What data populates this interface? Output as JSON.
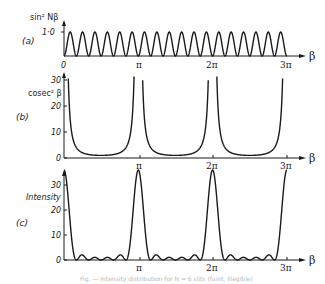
{
  "figure": {
    "caption": "Fig. — Intensity distribution for N = 6 slits (faint, illegible)",
    "x_axis_symbol": "β",
    "x_tick_labels": [
      "0",
      "π",
      "2π",
      "3π"
    ]
  },
  "chart_data": [
    {
      "panel": "(a)",
      "type": "line",
      "ylabel": "sin² Nβ",
      "xlabel": "β",
      "function": "sin^2(6β)",
      "x_range": [
        0,
        9.42
      ],
      "x_ticks": [
        "0",
        "π",
        "2π",
        "3π"
      ],
      "y_ticks": [
        "1·0"
      ],
      "ylim": [
        0,
        1.0
      ],
      "periods_per_pi": 6,
      "grid": false
    },
    {
      "panel": "(b)",
      "type": "line",
      "ylabel": "cosec² β",
      "xlabel": "β",
      "function": "1/sin^2(β)",
      "x_range": [
        0,
        9.42
      ],
      "x_ticks": [
        "π",
        "2π",
        "3π"
      ],
      "y_ticks": [
        "0",
        "10",
        "20",
        "30"
      ],
      "ylim": [
        0,
        35
      ],
      "asymptotes_at": [
        "0",
        "π",
        "2π",
        "3π"
      ],
      "minimum_value": 1,
      "grid": false
    },
    {
      "panel": "(c)",
      "type": "line",
      "ylabel": "Intensity",
      "xlabel": "β",
      "function": "sin^2(6β)/sin^2(β)",
      "x_range": [
        0,
        9.42
      ],
      "x_ticks": [
        "π",
        "2π",
        "3π"
      ],
      "y_ticks": [
        "0",
        "10",
        "20",
        "30"
      ],
      "ylim": [
        0,
        36
      ],
      "principal_maxima": [
        {
          "x": "0",
          "y": 36
        },
        {
          "x": "π",
          "y": 36
        },
        {
          "x": "2π",
          "y": 36
        },
        {
          "x": "3π",
          "y": 36
        }
      ],
      "secondary_maxima_per_interval": 4,
      "secondary_maxima_approx": [
        2.7,
        1.4,
        1.4,
        2.7
      ],
      "grid": false
    }
  ]
}
